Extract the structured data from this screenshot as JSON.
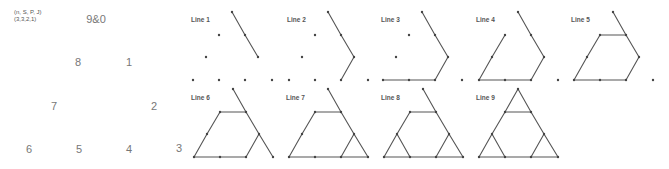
{
  "legend": {
    "line1": "(n, S, P, J)",
    "line2": "(3,3,2,1)"
  },
  "reference_positions": [
    {
      "label": "9&0",
      "x": 96,
      "y": 19
    },
    {
      "label": "8",
      "x": 78,
      "y": 62
    },
    {
      "label": "1",
      "x": 129,
      "y": 62
    },
    {
      "label": "7",
      "x": 54,
      "y": 106
    },
    {
      "label": "2",
      "x": 154,
      "y": 106
    },
    {
      "label": "6",
      "x": 29,
      "y": 149
    },
    {
      "label": "5",
      "x": 79,
      "y": 149
    },
    {
      "label": "4",
      "x": 129,
      "y": 149
    },
    {
      "label": "3",
      "x": 179,
      "y": 148
    }
  ],
  "grid_points_relative": [
    {
      "id": "9&0",
      "dx": 0,
      "dy": 0
    },
    {
      "id": "8",
      "dx": -13,
      "dy": 23
    },
    {
      "id": "1",
      "dx": 13,
      "dy": 23
    },
    {
      "id": "7",
      "dx": -26,
      "dy": 45
    },
    {
      "id": "2",
      "dx": 26,
      "dy": 45
    },
    {
      "id": "6",
      "dx": -39,
      "dy": 68
    },
    {
      "id": "5",
      "dx": -13,
      "dy": 68
    },
    {
      "id": "4",
      "dx": 13,
      "dy": 68
    },
    {
      "id": "3",
      "dx": 40,
      "dy": 68
    }
  ],
  "panels": [
    {
      "label": "Line 1",
      "label_x": 191,
      "label_y": 16,
      "apex_x": 232,
      "apex_y": 12,
      "segments": [
        [
          "9&0",
          "1"
        ],
        [
          "1",
          "2"
        ]
      ]
    },
    {
      "label": "Line 2",
      "label_x": 287,
      "label_y": 16,
      "apex_x": 328,
      "apex_y": 12,
      "segments": [
        [
          "9&0",
          "1"
        ],
        [
          "1",
          "2"
        ],
        [
          "2",
          "4"
        ]
      ]
    },
    {
      "label": "Line 3",
      "label_x": 381,
      "label_y": 16,
      "apex_x": 422,
      "apex_y": 12,
      "segments": [
        [
          "9&0",
          "1"
        ],
        [
          "1",
          "2"
        ],
        [
          "2",
          "4"
        ],
        [
          "4",
          "5"
        ],
        [
          "5",
          "6"
        ]
      ]
    },
    {
      "label": "Line 4",
      "label_x": 476,
      "label_y": 16,
      "apex_x": 518,
      "apex_y": 12,
      "segments": [
        [
          "9&0",
          "1"
        ],
        [
          "1",
          "2"
        ],
        [
          "2",
          "4"
        ],
        [
          "4",
          "5"
        ],
        [
          "5",
          "6"
        ],
        [
          "6",
          "7"
        ],
        [
          "7",
          "8"
        ]
      ]
    },
    {
      "label": "Line 5",
      "label_x": 571,
      "label_y": 16,
      "apex_x": 613,
      "apex_y": 12,
      "segments": [
        [
          "9&0",
          "1"
        ],
        [
          "1",
          "2"
        ],
        [
          "2",
          "4"
        ],
        [
          "4",
          "5"
        ],
        [
          "5",
          "6"
        ],
        [
          "6",
          "7"
        ],
        [
          "7",
          "8"
        ],
        [
          "8",
          "1"
        ]
      ]
    },
    {
      "label": "Line 6",
      "label_x": 191,
      "label_y": 94,
      "apex_x": 233,
      "apex_y": 89,
      "segments": [
        [
          "9&0",
          "1"
        ],
        [
          "1",
          "2"
        ],
        [
          "2",
          "4"
        ],
        [
          "4",
          "5"
        ],
        [
          "5",
          "6"
        ],
        [
          "6",
          "7"
        ],
        [
          "7",
          "8"
        ],
        [
          "8",
          "1"
        ],
        [
          "2",
          "3"
        ]
      ]
    },
    {
      "label": "Line 7",
      "label_x": 286,
      "label_y": 94,
      "apex_x": 328,
      "apex_y": 89,
      "segments": [
        [
          "9&0",
          "1"
        ],
        [
          "1",
          "2"
        ],
        [
          "2",
          "4"
        ],
        [
          "4",
          "5"
        ],
        [
          "5",
          "6"
        ],
        [
          "6",
          "7"
        ],
        [
          "7",
          "8"
        ],
        [
          "8",
          "1"
        ],
        [
          "2",
          "3"
        ],
        [
          "3",
          "4"
        ]
      ]
    },
    {
      "label": "Line 8",
      "label_x": 381,
      "label_y": 94,
      "apex_x": 423,
      "apex_y": 89,
      "segments": [
        [
          "9&0",
          "1"
        ],
        [
          "1",
          "2"
        ],
        [
          "2",
          "4"
        ],
        [
          "4",
          "5"
        ],
        [
          "5",
          "6"
        ],
        [
          "6",
          "7"
        ],
        [
          "7",
          "8"
        ],
        [
          "8",
          "1"
        ],
        [
          "2",
          "3"
        ],
        [
          "3",
          "4"
        ],
        [
          "7",
          "5"
        ]
      ]
    },
    {
      "label": "Line 9",
      "label_x": 476,
      "label_y": 94,
      "apex_x": 518,
      "apex_y": 89,
      "segments": [
        [
          "9&0",
          "1"
        ],
        [
          "1",
          "2"
        ],
        [
          "2",
          "4"
        ],
        [
          "4",
          "5"
        ],
        [
          "5",
          "6"
        ],
        [
          "6",
          "7"
        ],
        [
          "7",
          "8"
        ],
        [
          "8",
          "1"
        ],
        [
          "2",
          "3"
        ],
        [
          "3",
          "4"
        ],
        [
          "7",
          "5"
        ],
        [
          "9&0",
          "8"
        ]
      ]
    }
  ],
  "colors": {
    "line": "#555555",
    "dot": "#444444",
    "number_text": "#777777",
    "label_text": "#555555"
  }
}
